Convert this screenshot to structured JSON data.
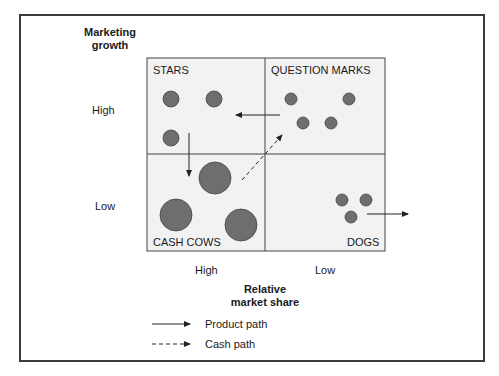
{
  "y_axis": {
    "title_line1": "Marketing",
    "title_line2": "growth",
    "high": "High",
    "low": "Low"
  },
  "x_axis": {
    "title_line1": "Relative",
    "title_line2": "market share",
    "high": "High",
    "low": "Low"
  },
  "quadrants": {
    "top_left": "STARS",
    "top_right": "QUESTION MARKS",
    "bottom_left": "CASH COWS",
    "bottom_right": "DOGS"
  },
  "legend": {
    "product_path": "Product path",
    "cash_path": "Cash path"
  },
  "colors": {
    "quadrant_fill": "#f2f2f2",
    "circle_fill": "#6e6e6e",
    "line": "#333333"
  }
}
